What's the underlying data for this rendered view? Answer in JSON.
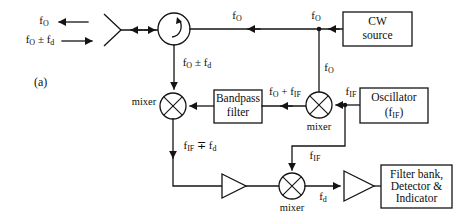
{
  "figure": {
    "panel_label": "(a)",
    "background_color": "#ffffff",
    "line_color": "#141414"
  },
  "blocks": {
    "cw_source": {
      "line1": "CW",
      "line2": "source"
    },
    "oscillator": {
      "line1": "Oscillator",
      "line2_prefix": "(f",
      "line2_sub": "IF",
      "line2_suffix": ")"
    },
    "bandpass": {
      "line1": "Bandpass",
      "line2": "filter"
    },
    "output": {
      "line1": "Filter bank,",
      "line2": "Detector &",
      "line3": "Indicator"
    }
  },
  "components": {
    "antenna": "antenna",
    "circulator": "circulator",
    "mixer_left": "mixer",
    "mixer_upper_right": "mixer",
    "mixer_bottom": "mixer",
    "amplifier_left": "amplifier",
    "amplifier_right": "amplifier"
  },
  "captions": {
    "mixer_left": "mixer",
    "mixer_upper_right": "mixer",
    "mixer_bottom": "mixer"
  },
  "signals": {
    "tx_out": {
      "base": "f",
      "sub": "O"
    },
    "rx_in": {
      "base": "f",
      "sub": "O",
      "op": " ± f",
      "sub2": "d"
    },
    "circ_to_cw": {
      "base": "f",
      "sub": "O"
    },
    "cw_out": {
      "base": "f",
      "sub": "O"
    },
    "cw_down": {
      "base": "f",
      "sub": "O"
    },
    "circ_down": {
      "base": "f",
      "sub": "O",
      "op": " ± f",
      "sub2": "d"
    },
    "mix_sum": {
      "base": "f",
      "sub": "O",
      "op": " + f",
      "sub2": "IF"
    },
    "osc_out": {
      "base": "f",
      "sub": "IF"
    },
    "osc_down": {
      "base": "f",
      "sub": "IF"
    },
    "if_doppler": {
      "base": "f",
      "sub": "IF",
      "op": " ∓ f",
      "sub2": "d"
    },
    "doppler": {
      "base": "f",
      "sub": "d"
    }
  }
}
